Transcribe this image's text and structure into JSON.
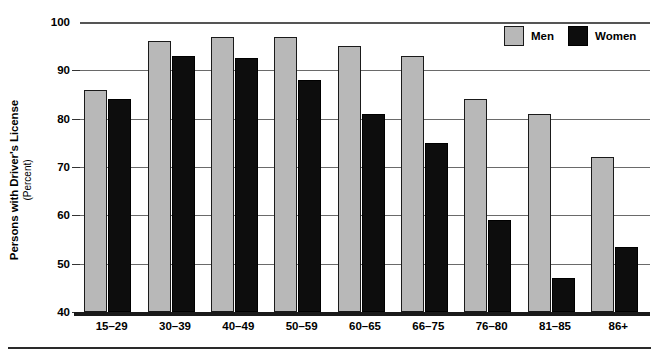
{
  "axis": {
    "y_title": "Persons with Driver's License",
    "y_subtitle": "(Percent)",
    "y_ticks": [
      "100",
      "90",
      "80",
      "70",
      "60",
      "50",
      "40"
    ]
  },
  "legend": {
    "entries": [
      {
        "label": "Men",
        "color": "#b8b8b8",
        "swatch": "men-swatch"
      },
      {
        "label": "Women",
        "color": "#0d0d0d",
        "swatch": "women-swatch"
      }
    ]
  },
  "chart_data": {
    "type": "bar",
    "title": "",
    "xlabel": "",
    "ylabel": "Persons with Driver's License (Percent)",
    "ylim": [
      40,
      100
    ],
    "ytick_step": 10,
    "grid": true,
    "legend_position": "top-right",
    "categories": [
      "15–29",
      "30–39",
      "40–49",
      "50–59",
      "60–65",
      "66–75",
      "76–80",
      "81–85",
      "86+"
    ],
    "series": [
      {
        "name": "Men",
        "color": "#b8b8b8",
        "values": [
          86,
          96,
          97,
          97,
          95,
          93,
          84,
          81,
          72
        ]
      },
      {
        "name": "Women",
        "color": "#0d0d0d",
        "values": [
          84,
          93,
          92.5,
          88,
          81,
          75,
          59,
          47,
          53.5
        ]
      }
    ]
  }
}
